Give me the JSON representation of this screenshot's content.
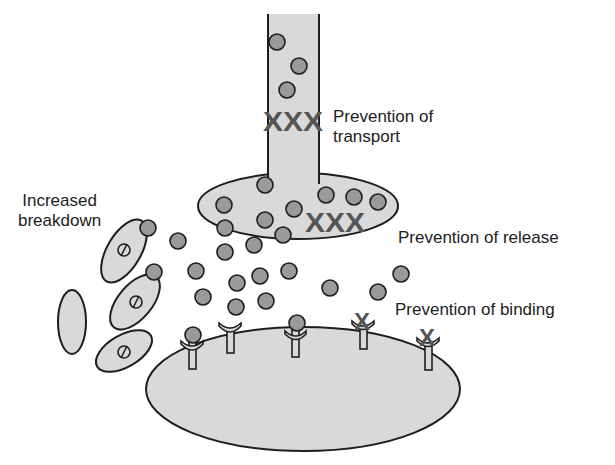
{
  "labels": {
    "transport_line1": "Prevention of",
    "transport_line2": "transport",
    "release": "Prevention of release",
    "binding": "Prevention of binding",
    "breakdown_line1": "Increased",
    "breakdown_line2": "breakdown"
  },
  "blocker_glyphs": {
    "transport": "XXX",
    "release": "XXX",
    "receptor_block": "X"
  },
  "colors": {
    "fill_light": "#d9d9d9",
    "molecule": "#9a9a9a",
    "stroke": "#1e1e1e",
    "blocker": "#555555"
  }
}
